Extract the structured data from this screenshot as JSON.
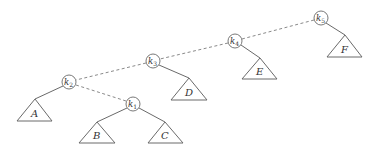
{
  "diagram": {
    "type": "binary-search-tree-rotation",
    "nodes": [
      {
        "id": "k5",
        "letter": "k",
        "sub": "5",
        "cx": 321,
        "cy": 18
      },
      {
        "id": "k4",
        "letter": "k",
        "sub": "4",
        "cx": 235,
        "cy": 41
      },
      {
        "id": "k3",
        "letter": "k",
        "sub": "3",
        "cx": 153,
        "cy": 61
      },
      {
        "id": "k2",
        "letter": "k",
        "sub": "2",
        "cx": 69,
        "cy": 82
      },
      {
        "id": "k1",
        "letter": "k",
        "sub": "1",
        "cx": 133,
        "cy": 104
      }
    ],
    "subtrees": [
      {
        "id": "A",
        "label": "A",
        "parent": "k2"
      },
      {
        "id": "B",
        "label": "B",
        "parent": "k1"
      },
      {
        "id": "C",
        "label": "C",
        "parent": "k1"
      },
      {
        "id": "D",
        "label": "D",
        "parent": "k3"
      },
      {
        "id": "E",
        "label": "E",
        "parent": "k4"
      },
      {
        "id": "F",
        "label": "F",
        "parent": "k5"
      }
    ],
    "dashed_edges": [
      [
        "k5",
        "k4"
      ],
      [
        "k4",
        "k3"
      ],
      [
        "k3",
        "k2"
      ],
      [
        "k2",
        "k1"
      ]
    ],
    "solid_edges": [
      [
        "k2",
        "A"
      ],
      [
        "k1",
        "B"
      ],
      [
        "k1",
        "C"
      ],
      [
        "k3",
        "D"
      ],
      [
        "k4",
        "E"
      ],
      [
        "k5",
        "F"
      ]
    ]
  }
}
